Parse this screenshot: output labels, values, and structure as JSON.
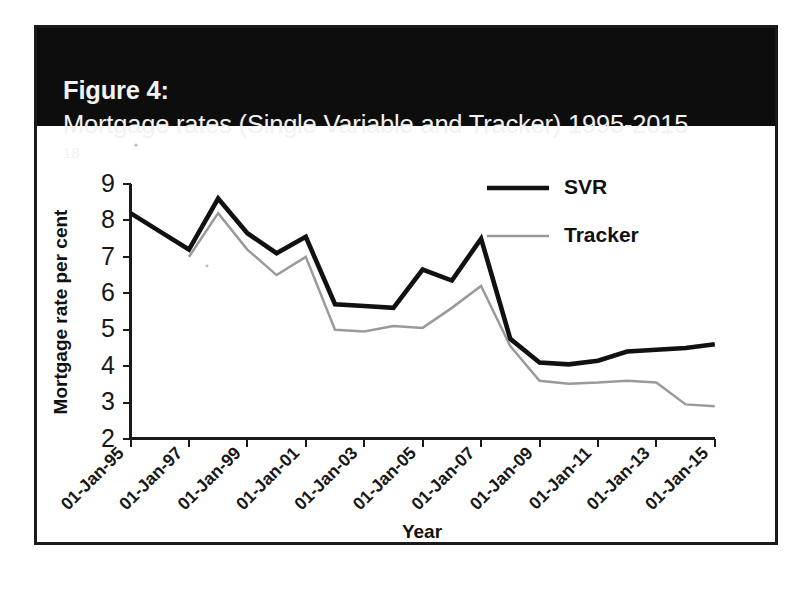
{
  "figure": {
    "label": "Figure 4:",
    "caption": "Mortgage rates (Single Variable and Tracker) 1995-2015",
    "footnote_marker": "18",
    "title_full": "Figure 4: Mortgage rates (Single Variable and Tracker) 1995-2015 18"
  },
  "colors": {
    "banner_background": "#0d0d0d",
    "banner_text": "#f2f2f2",
    "frame": "#1a1a1a",
    "svr_line": "#111111",
    "tracker_line": "#9a9a9a",
    "plot_background": "#ffffff"
  },
  "chart_data": {
    "type": "line",
    "title": "Mortgage rates (Single Variable and Tracker) 1995-2015",
    "xlabel": "Year",
    "ylabel": "Mortgage rate per cent",
    "grid": false,
    "legend_position": "top-right",
    "ylim": [
      2,
      9
    ],
    "yticks": [
      2,
      3,
      4,
      5,
      6,
      7,
      8,
      9
    ],
    "ytick_labels": [
      "2",
      "3",
      "4",
      "5",
      "6",
      "7",
      "8",
      "9"
    ],
    "xtick_labels": [
      "01-Jan-95",
      "01-Jan-97",
      "01-Jan-99",
      "01-Jan-01",
      "01-Jan-03",
      "01-Jan-05",
      "01-Jan-07",
      "01-Jan-09",
      "01-Jan-11",
      "01-Jan-13",
      "01-Jan-15"
    ],
    "x": [
      1995,
      1996,
      1997,
      1998,
      1999,
      2000,
      2001,
      2002,
      2003,
      2004,
      2005,
      2006,
      2007,
      2008,
      2009,
      2010,
      2011,
      2012,
      2013,
      2014,
      2015
    ],
    "series": [
      {
        "name": "SVR",
        "color": "#111111",
        "style": "solid-thick",
        "values": [
          8.2,
          7.7,
          7.2,
          8.6,
          7.65,
          7.1,
          7.55,
          5.7,
          5.65,
          5.6,
          6.65,
          6.35,
          7.5,
          4.75,
          4.1,
          4.05,
          4.15,
          4.4,
          4.45,
          4.5,
          4.6
        ]
      },
      {
        "name": "Tracker",
        "color": "#9a9a9a",
        "style": "solid-thin",
        "values": [
          null,
          null,
          7.0,
          8.2,
          7.2,
          6.5,
          7.0,
          5.0,
          4.95,
          5.1,
          5.05,
          5.6,
          6.2,
          4.55,
          3.6,
          3.52,
          3.55,
          3.6,
          3.55,
          2.95,
          2.9
        ]
      }
    ]
  },
  "legend": {
    "items": [
      {
        "label": "SVR"
      },
      {
        "label": "Tracker"
      }
    ]
  },
  "axes": {
    "x_axis_title": "Year",
    "y_axis_title": "Mortgage rate per cent"
  }
}
